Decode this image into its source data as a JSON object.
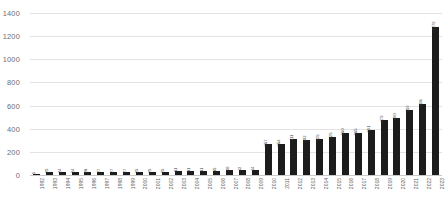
{
  "chart_data": {
    "type": "bar",
    "title": "",
    "subtitle": "",
    "xlabel": "",
    "ylabel": "",
    "ylim": [
      0,
      1400
    ],
    "yticks": [
      0,
      200,
      400,
      600,
      800,
      1000,
      1200,
      1400
    ],
    "grid": true,
    "legend": "none",
    "bar_color": "#1c1c1c",
    "gridline_color": "#e3e3e3",
    "tick_label_color": "#6d6d6d",
    "value_labels_shown": true,
    "value_label_rotation": -90,
    "tick_label_rotation": -90,
    "categories": [
      "1992",
      "1993",
      "1994",
      "1995",
      "1996",
      "1997",
      "1998",
      "1999",
      "2000",
      "2001",
      "2002",
      "2003",
      "2004",
      "2005",
      "2006",
      "2007",
      "2008",
      "2009",
      "2010",
      "2011",
      "2012",
      "2013",
      "2014",
      "2015",
      "2016",
      "2017",
      "2018",
      "2019",
      "2020",
      "2021",
      "2022",
      "2023"
    ],
    "values": [
      1,
      25,
      24,
      24,
      28,
      27,
      27,
      27,
      25,
      25,
      25,
      31,
      31,
      31,
      35,
      40,
      42,
      44,
      267,
      264,
      311,
      302,
      315,
      325,
      360,
      365,
      391,
      479,
      490,
      559,
      618,
      1279
    ],
    "labels": [
      "1",
      "25",
      "24",
      "24",
      "28",
      "27",
      "27",
      "27",
      "25",
      "25",
      "25",
      "31",
      "31",
      "31",
      "35",
      "40",
      "42",
      "44",
      "267",
      "264",
      "311",
      "302",
      "315",
      "325",
      "360",
      "365",
      "391",
      "479",
      "490",
      "559",
      "618",
      "1279"
    ]
  }
}
